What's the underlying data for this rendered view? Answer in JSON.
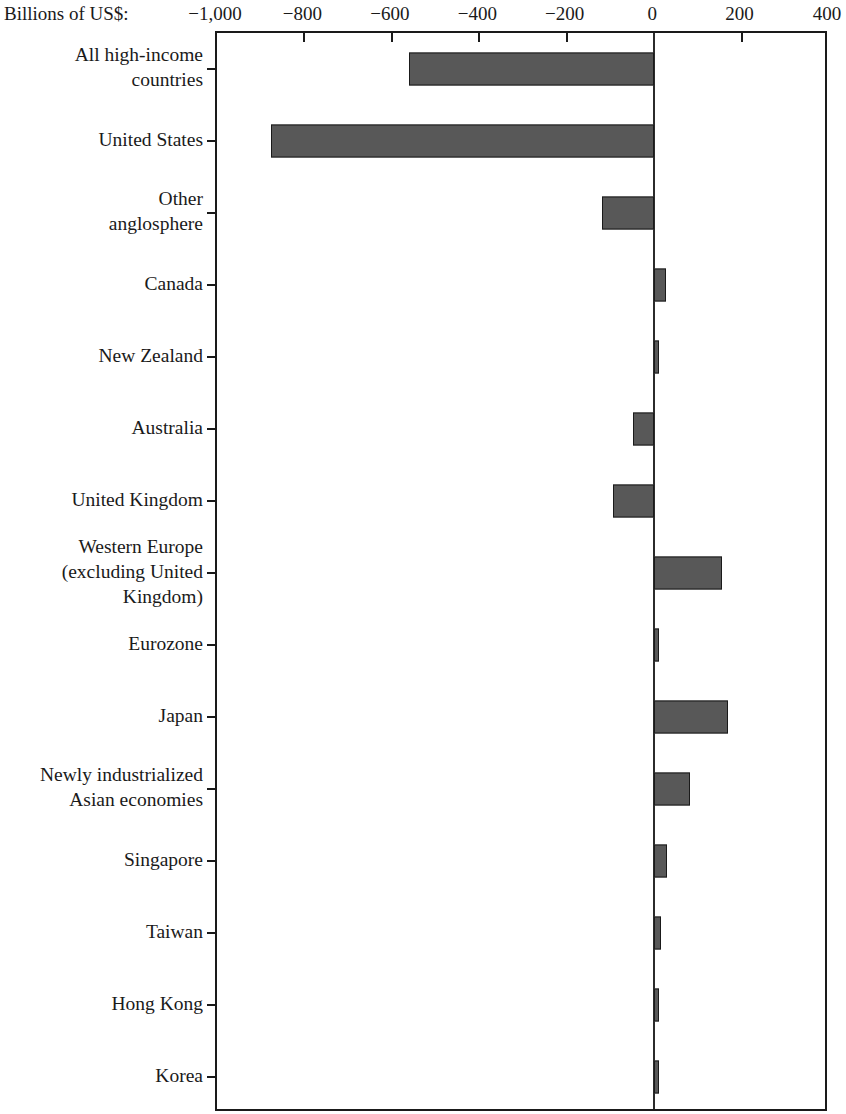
{
  "chart": {
    "type": "bar",
    "orientation": "horizontal",
    "unit_label": "Billions of US$:",
    "title": "",
    "xlabel": "",
    "ylabel": "",
    "xlim": [
      -1000,
      400
    ],
    "xticks": [
      -1000,
      -800,
      -600,
      -400,
      -200,
      0,
      400
    ],
    "xtick_labels": [
      "−1,000",
      "−800",
      "−600",
      "−400",
      "−200",
      "0",
      "400"
    ],
    "grid": false,
    "legend": "none",
    "bar_color": "#585858",
    "bar_edge_color": "#1a1a1a",
    "axis_color": "#1a1a1a"
  },
  "chart_data": {
    "type": "bar",
    "title": "",
    "xlabel": "Billions of US$:",
    "ylabel": "",
    "xlim": [
      -1000,
      400
    ],
    "grid": false,
    "legend": "none",
    "categories": [
      "All high-income\ncountries",
      "United States",
      "Other\nanglosphere",
      "Canada",
      "New Zealand",
      "Australia",
      "United Kingdom",
      "Western Europe\n(excluding United\nKingdom)",
      "Eurozone",
      "Japan",
      "Newly industrialized\nAsian economies",
      "Singapore",
      "Taiwan",
      "Hong Kong",
      "Korea"
    ],
    "values": [
      -560,
      -876,
      -120,
      28,
      6,
      -48,
      -94,
      156,
      7,
      168,
      83,
      30,
      16,
      12,
      8
    ],
    "xticks": [
      -1000,
      -800,
      -600,
      -400,
      -200,
      0,
      400
    ],
    "xtick_labels": [
      "−1,000",
      "−800",
      "−600",
      "−400",
      "−200",
      "0",
      "400"
    ]
  },
  "ticks_extra": {
    "tick_200": 200,
    "tick_200_label": "200"
  }
}
